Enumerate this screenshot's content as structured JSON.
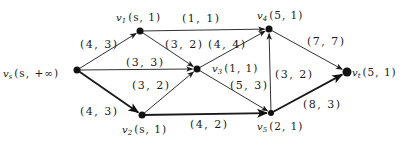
{
  "diagram": {
    "type": "network-flow",
    "nodes": [
      {
        "id": "vs",
        "name": "v",
        "sub": "s",
        "label": "(s, +∞)",
        "x": 77,
        "y": 70,
        "lx": 3,
        "ly": 77,
        "r": 3.5
      },
      {
        "id": "v1",
        "name": "v",
        "sub": "1",
        "label": "(s, 1)",
        "x": 140,
        "y": 31,
        "lx": 116,
        "ly": 21,
        "r": 3.5
      },
      {
        "id": "v2",
        "name": "v",
        "sub": "2",
        "label": "(s, 1)",
        "x": 142,
        "y": 115,
        "lx": 122,
        "ly": 133,
        "r": 3.5
      },
      {
        "id": "v3",
        "name": "v",
        "sub": "3",
        "label": "(1, 1)",
        "x": 197,
        "y": 69,
        "lx": 212,
        "ly": 72,
        "r": 3.5
      },
      {
        "id": "v4",
        "name": "v",
        "sub": "4",
        "label": "(5, 1)",
        "x": 269,
        "y": 29,
        "lx": 257,
        "ly": 19,
        "r": 3.5
      },
      {
        "id": "v5",
        "name": "v",
        "sub": "5",
        "label": "(2, 1)",
        "x": 271,
        "y": 113,
        "lx": 257,
        "ly": 130,
        "r": 3
      },
      {
        "id": "vt",
        "name": "v",
        "sub": "t",
        "label": "(5, 1)",
        "x": 347,
        "y": 72,
        "lx": 352,
        "ly": 76,
        "r": 4.5
      }
    ],
    "edges": [
      {
        "from": "vs",
        "to": "v1",
        "label": "(4, 3)",
        "lx": 80,
        "ly": 48,
        "bold": false
      },
      {
        "from": "vs",
        "to": "v3",
        "label": "(3, 3)",
        "lx": 126,
        "ly": 66,
        "bold": false
      },
      {
        "from": "vs",
        "to": "v2",
        "label": "(4, 3)",
        "lx": 80,
        "ly": 115,
        "bold": true
      },
      {
        "from": "v1",
        "to": "v4",
        "label": "(1, 1)",
        "lx": 182,
        "ly": 22,
        "bold": false
      },
      {
        "from": "v1",
        "to": "v3",
        "label": "(3, 2)",
        "lx": 165,
        "ly": 48,
        "bold": false
      },
      {
        "from": "v2",
        "to": "v3",
        "label": "(3, 2)",
        "lx": 132,
        "ly": 89,
        "bold": false
      },
      {
        "from": "v3",
        "to": "v4",
        "label": "(4, 4)",
        "lx": 208,
        "ly": 48,
        "bold": false
      },
      {
        "from": "v3",
        "to": "v5",
        "label": "(5, 3)",
        "lx": 230,
        "ly": 89,
        "bold": false
      },
      {
        "from": "v2",
        "to": "v5",
        "label": "(4, 2)",
        "lx": 190,
        "ly": 128,
        "bold": true
      },
      {
        "from": "v5",
        "to": "v4",
        "label": "(3, 2)",
        "lx": 275,
        "ly": 78,
        "bold": false
      },
      {
        "from": "v4",
        "to": "vt",
        "label": "(7, 7)",
        "lx": 307,
        "ly": 45,
        "bold": false
      },
      {
        "from": "v5",
        "to": "vt",
        "label": "(8, 3)",
        "lx": 303,
        "ly": 108,
        "bold": true
      }
    ]
  }
}
